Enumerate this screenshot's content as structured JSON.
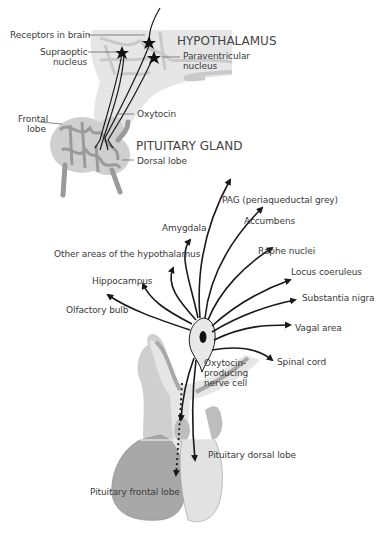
{
  "top_diagram": {
    "title_hypothalamus": "HYPOTHALAMUS",
    "title_pituitary": "PITUITARY GLAND",
    "labels": {
      "receptors": "Receptors in brain",
      "supraoptic_1": "Supraoptic",
      "supraoptic_2": "nucleus",
      "paraventricular_1": "Paraventricular",
      "paraventricular_2": "nucleus",
      "oxytocin": "Oxytocin",
      "frontal_1": "Frontal",
      "frontal_2": "lobe",
      "dorsal": "Dorsal lobe"
    }
  },
  "bottom_diagram": {
    "targets": {
      "pag": "PAG (periaqueductal grey)",
      "amygdala": "Amygdala",
      "accumbens": "Accumbens",
      "other_hypothalamus": "Other areas of the hypothalamus",
      "raphe": "Raphe nuclei",
      "hippocampus": "Hippocampus",
      "locus": "Locus coeruleus",
      "substantia": "Substantia nigra",
      "olfactory": "Olfactory bulb",
      "vagal": "Vagal area",
      "spinal": "Spinal cord"
    },
    "cell_1": "Oxytocin-",
    "cell_2": "producing",
    "cell_3": "nerve cell",
    "pituitary_dorsal": "Pituitary dorsal lobe",
    "pituitary_frontal": "Pituitary frontal lobe"
  },
  "colors": {
    "light_gray": "#e6e6e6",
    "mid_gray": "#bdbdbd",
    "dark_gray": "#9a9a9a",
    "line": "#1a1a1a"
  }
}
